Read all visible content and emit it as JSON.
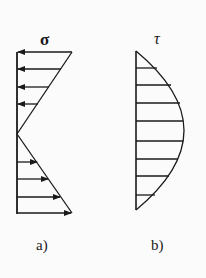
{
  "diagram": {
    "panel_a": {
      "symbol": "σ",
      "caption": "a)",
      "description": "Linear normal stress distribution, compressive (left arrows) above neutral axis, tensile (right arrows) below"
    },
    "panel_b": {
      "symbol": "τ",
      "caption": "b)",
      "description": "Parabolic shear stress distribution, maximum at neutral axis"
    },
    "colors": {
      "line": "#1a1a1a",
      "background": "#fbfbfb"
    }
  }
}
